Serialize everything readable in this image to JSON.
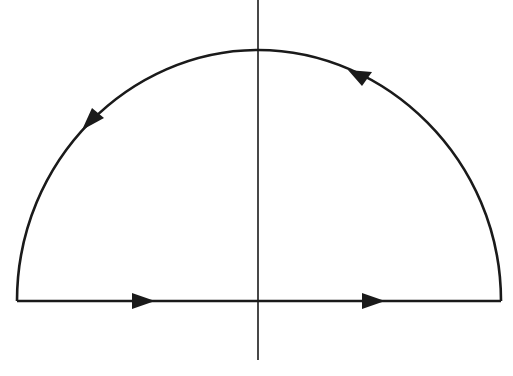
{
  "diagram": {
    "colors": {
      "stroke": "#1a1a1a",
      "background": "#ffffff"
    },
    "axis": {
      "x": 258,
      "y_top": 0,
      "y_bottom": 360
    },
    "contour": {
      "baseline_y": 301,
      "left_x": 17,
      "right_x": 501,
      "top_y": 50,
      "orientation": "counterclockwise"
    },
    "arrows": [
      {
        "segment": "baseline-left",
        "direction": "right"
      },
      {
        "segment": "baseline-right",
        "direction": "right"
      },
      {
        "segment": "arc-upper-right",
        "direction": "up-left"
      },
      {
        "segment": "arc-upper-left",
        "direction": "down-left"
      }
    ]
  }
}
